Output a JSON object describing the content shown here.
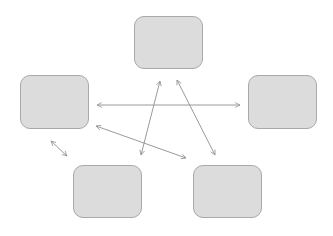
{
  "diagram": {
    "type": "network",
    "background": "#ffffff",
    "node_fill": "#dcdcdc",
    "node_stroke": "#a9a9a9",
    "edge_color": "#9a9a9a",
    "nodes": [
      {
        "id": "top",
        "label": "",
        "x": 134,
        "y": 16,
        "w": 69,
        "h": 53
      },
      {
        "id": "left",
        "label": "",
        "x": 20,
        "y": 75,
        "w": 69,
        "h": 54
      },
      {
        "id": "right",
        "label": "",
        "x": 248,
        "y": 75,
        "w": 69,
        "h": 54
      },
      {
        "id": "bottom-left",
        "label": "",
        "x": 73,
        "y": 165,
        "w": 69,
        "h": 53
      },
      {
        "id": "bottom-right",
        "label": "",
        "x": 193,
        "y": 165,
        "w": 69,
        "h": 53
      }
    ],
    "edges": [
      {
        "from": "left",
        "to": "right",
        "x1": 97,
        "y1": 105,
        "x2": 240,
        "y2": 105,
        "bidirectional": true
      },
      {
        "from": "top",
        "to": "bottom-left",
        "x1": 160,
        "y1": 81,
        "x2": 141,
        "y2": 155,
        "bidirectional": true
      },
      {
        "from": "top",
        "to": "bottom-right",
        "x1": 177,
        "y1": 80,
        "x2": 215,
        "y2": 155,
        "bidirectional": true
      },
      {
        "from": "left",
        "to": "bottom-right",
        "x1": 96,
        "y1": 126,
        "x2": 186,
        "y2": 158,
        "bidirectional": true
      },
      {
        "from": "left",
        "to": "bottom-left",
        "x1": 51,
        "y1": 141,
        "x2": 67,
        "y2": 156,
        "bidirectional": true
      }
    ]
  }
}
